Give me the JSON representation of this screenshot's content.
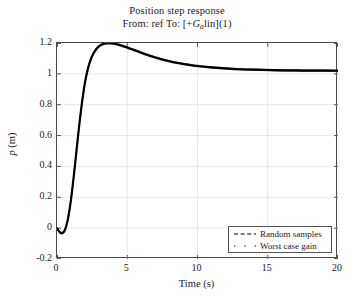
{
  "chart_data": {
    "type": "line",
    "title": "Position step response",
    "subtitle": "From: ref To: [+G_a lin](1)",
    "subtitle_parts": {
      "pre": "From: ref To: [+",
      "var": "G",
      "sub": "a",
      "post": "lin](1)"
    },
    "xlabel": "Time (s)",
    "ylabel": "p (m)",
    "ylabel_parts": {
      "var": "p",
      "unit": "(m)"
    },
    "xlim": [
      0,
      20
    ],
    "ylim": [
      -0.2,
      1.2
    ],
    "xticks": [
      0,
      5,
      10,
      15,
      20
    ],
    "xtick_labels": [
      "0",
      "5",
      "10",
      "15",
      "20"
    ],
    "yticks": [
      -0.2,
      0,
      0.2,
      0.4,
      0.6,
      0.8,
      1,
      1.2
    ],
    "ytick_labels": [
      "-0.2",
      "0",
      "0.2",
      "0.4",
      "0.6",
      "0.8",
      "1",
      "1.2"
    ],
    "grid": true,
    "grid_color": "#e8e8e8",
    "axes_color": "#4a4a4a",
    "line_color": "#000000",
    "line_width": 2.2,
    "legend_position": "lower right",
    "legend": [
      {
        "label": "Random samples",
        "style": "dashed"
      },
      {
        "label": "Worst case gain",
        "style": "dotted"
      }
    ],
    "series": [
      {
        "name": "Worst case gain",
        "x": [
          0.0,
          0.1,
          0.2,
          0.3,
          0.4,
          0.5,
          0.6,
          0.7,
          0.8,
          0.9,
          1.0,
          1.1,
          1.2,
          1.3,
          1.4,
          1.5,
          1.6,
          1.7,
          1.8,
          1.9,
          2.0,
          2.2,
          2.4,
          2.6,
          2.8,
          3.0,
          3.2,
          3.4,
          3.6,
          3.8,
          4.0,
          4.3,
          4.6,
          5.0,
          5.5,
          6.0,
          6.5,
          7.0,
          7.5,
          8.0,
          8.5,
          9.0,
          9.5,
          10.0,
          11.0,
          12.0,
          13.0,
          14.0,
          15.0,
          16.0,
          17.0,
          18.0,
          19.0,
          20.0
        ],
        "y": [
          0.0,
          -0.014,
          -0.026,
          -0.032,
          -0.031,
          -0.022,
          -0.003,
          0.028,
          0.07,
          0.124,
          0.188,
          0.262,
          0.342,
          0.427,
          0.513,
          0.598,
          0.68,
          0.757,
          0.828,
          0.892,
          0.948,
          1.034,
          1.093,
          1.133,
          1.161,
          1.18,
          1.191,
          1.197,
          1.199,
          1.199,
          1.197,
          1.191,
          1.183,
          1.171,
          1.154,
          1.137,
          1.121,
          1.106,
          1.093,
          1.082,
          1.072,
          1.064,
          1.057,
          1.051,
          1.042,
          1.035,
          1.03,
          1.027,
          1.025,
          1.023,
          1.022,
          1.021,
          1.021,
          1.02
        ]
      }
    ]
  }
}
